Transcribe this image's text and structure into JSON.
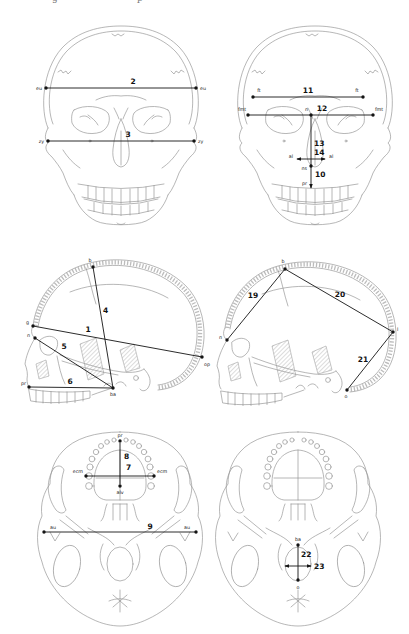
{
  "figure": {
    "top_edge_text_fragments": [
      "g",
      "p"
    ],
    "colors": {
      "line_art": "#909090",
      "measurement": "#141414",
      "background": "#ffffff"
    },
    "panels": {
      "frontal_left": {
        "measurements": {
          "m2": "2",
          "m3": "3"
        },
        "landmarks": {
          "eu_left": "eu",
          "eu_right": "eu",
          "zy_left": "zy",
          "zy_right": "zy"
        }
      },
      "frontal_right": {
        "measurements": {
          "m10": "10",
          "m11": "11",
          "m12": "12",
          "m13": "13",
          "m14": "14"
        },
        "landmarks": {
          "ft_left": "ft",
          "ft_right": "ft",
          "fmt_left": "fmt",
          "fmt_right": "fmt",
          "n": "n",
          "al_left": "al",
          "al_right": "al",
          "ns": "ns",
          "pr": "pr"
        }
      },
      "lateral_left": {
        "measurements": {
          "m1": "1",
          "m4": "4",
          "m5": "5",
          "m6": "6"
        },
        "landmarks": {
          "b": "b",
          "g": "g",
          "n": "n",
          "pr": "pr",
          "ba": "ba",
          "op": "op"
        }
      },
      "lateral_right": {
        "measurements": {
          "m19": "19",
          "m20": "20",
          "m21": "21"
        },
        "landmarks": {
          "b": "b",
          "n": "n",
          "l": "l",
          "o": "o"
        }
      },
      "basal_left": {
        "measurements": {
          "m7": "7",
          "m8": "8",
          "m9": "9"
        },
        "landmarks": {
          "pr": "pr",
          "alv": "alv",
          "ecm_left": "ecm",
          "ecm_right": "ecm",
          "au_left": "au",
          "au_right": "au"
        }
      },
      "basal_right": {
        "measurements": {
          "m22": "22",
          "m23": "23"
        },
        "landmarks": {
          "ba": "ba",
          "o": "o"
        }
      }
    }
  }
}
